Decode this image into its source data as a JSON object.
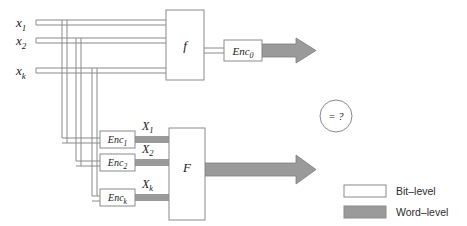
{
  "diagram": {
    "colors": {
      "bit_level_fill": "#ffffff",
      "bit_level_stroke": "#8a8a8a",
      "word_level_fill": "#9a9a9a",
      "box_stroke": "#8a8a8a",
      "text": "#1a1a1a"
    },
    "inputs": [
      {
        "name": "input-x1",
        "label": "x",
        "sub": "1"
      },
      {
        "name": "input-x2",
        "label": "x",
        "sub": "2"
      },
      {
        "name": "input-xk",
        "label": "x",
        "sub": "k"
      }
    ],
    "bit_block": {
      "name": "function-f-box",
      "label": "f"
    },
    "word_block": {
      "name": "function-F-box",
      "label": "F"
    },
    "encoders_output": [
      {
        "name": "encoder-enc0",
        "label": "Enc",
        "sub": "0"
      }
    ],
    "encoders_input": [
      {
        "name": "encoder-enc1",
        "label": "Enc",
        "sub": "1"
      },
      {
        "name": "encoder-enc2",
        "label": "Enc",
        "sub": "2"
      },
      {
        "name": "encoder-enck",
        "label": "Enc",
        "sub": "k"
      }
    ],
    "word_inputs": [
      {
        "name": "word-input-X1",
        "label": "X",
        "sub": "1"
      },
      {
        "name": "word-input-X2",
        "label": "X",
        "sub": "2"
      },
      {
        "name": "word-input-Xk",
        "label": "X",
        "sub": "k"
      }
    ],
    "comparator": {
      "name": "equivalence-check",
      "label": "= ?"
    },
    "legend": {
      "name": "legend",
      "items": [
        {
          "name": "legend-bit-level",
          "label": "Bit–level",
          "swatch": "bit"
        },
        {
          "name": "legend-word-level",
          "label": "Word–level",
          "swatch": "word"
        }
      ]
    }
  }
}
